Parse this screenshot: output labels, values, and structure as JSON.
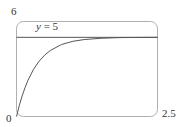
{
  "chart_data": {
    "type": "line",
    "title": "",
    "xlabel": "",
    "ylabel": "",
    "xlim": [
      0,
      2.5
    ],
    "ylim": [
      0,
      6
    ],
    "grid": false,
    "tick_labels": {
      "y_top": "6",
      "origin": "0",
      "x_right": "2.5"
    },
    "series": [
      {
        "name": "curve",
        "type": "line",
        "x": [
          0,
          0.05,
          0.1,
          0.15,
          0.2,
          0.3,
          0.4,
          0.5,
          0.6,
          0.8,
          1.0,
          1.2,
          1.5,
          1.8,
          2.0,
          2.5
        ],
        "values": [
          0,
          0.7,
          1.3,
          1.81,
          2.26,
          2.97,
          3.49,
          3.88,
          4.17,
          4.55,
          4.75,
          4.86,
          4.94,
          4.98,
          4.99,
          5.0
        ]
      },
      {
        "name": "asymptote",
        "type": "hline",
        "y": 5,
        "label": "y = 5"
      }
    ]
  },
  "labels": {
    "y_top": "6",
    "origin": "0",
    "x_right": "2.5",
    "asymptote_var": "y",
    "asymptote_rest": " = 5"
  },
  "colors": {
    "frame": "#b0b0b0",
    "curve": "#555555",
    "asymptote": "#555555"
  }
}
